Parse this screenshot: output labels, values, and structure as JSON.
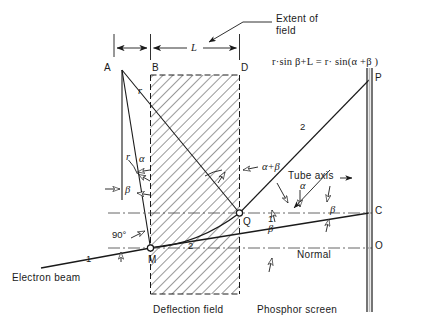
{
  "diagram": {
    "formula": "r·sin β+L  =  r· sin(α +β )",
    "annotations": {
      "extent_of_field_line1": "Extent of",
      "extent_of_field_line2": "field",
      "dimension_L": "L",
      "tube_axis": "Tube axis",
      "normal": "Normal",
      "electron_beam": "Electron beam",
      "deflection_field": "Deflection field",
      "phosphor_screen": "Phosphor screen",
      "right_angle": "90°"
    },
    "points": {
      "A": "A",
      "B": "B",
      "D": "D",
      "M": "M",
      "Q": "Q",
      "P": "P",
      "C": "C",
      "O": "O"
    },
    "angles": {
      "alpha_left": "α",
      "beta_left": "β",
      "alpha_plus_beta": "α+β",
      "alpha_right": "α",
      "beta_right": "β",
      "beta_lower": "β"
    },
    "radii": {
      "r_upper": "r",
      "r_lower": "r"
    },
    "ray_numbers": {
      "incident": "1",
      "inside": "2",
      "emergent_lower": "1",
      "emergent_upper": "2"
    },
    "colors": {
      "ink": "#1a1a1a",
      "hatch": "#3a3a3a",
      "dash": "#555555",
      "background": "#ffffff"
    }
  }
}
